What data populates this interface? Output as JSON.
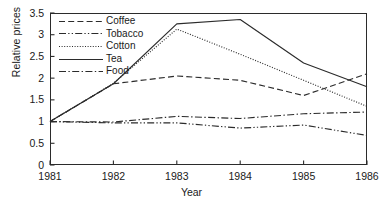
{
  "chart_data": {
    "type": "line",
    "title": "",
    "xlabel": "Year",
    "ylabel": "Relative prices",
    "x": [
      1981,
      1982,
      1983,
      1984,
      1985,
      1986
    ],
    "xtick_labels": [
      "1981",
      "1982",
      "1983",
      "1984",
      "1985",
      "1986"
    ],
    "ytick_labels": [
      "0",
      "0.5",
      "1",
      "1.5",
      "2",
      "2.5",
      "3",
      "3.5"
    ],
    "ytick_values": [
      0,
      0.5,
      1,
      1.5,
      2,
      2.5,
      3,
      3.5
    ],
    "xlim": [
      1981,
      1986
    ],
    "ylim": [
      0,
      3.5
    ],
    "grid": false,
    "legend_position": "upper-left-inside",
    "series": [
      {
        "name": "Coffee",
        "dash": "dashed",
        "color": "#2b2b2b",
        "values": [
          1.0,
          1.87,
          2.05,
          1.95,
          1.6,
          2.1
        ]
      },
      {
        "name": "Tobacco",
        "dash": "dash-dot-dot",
        "color": "#2b2b2b",
        "values": [
          1.0,
          0.97,
          0.97,
          0.85,
          0.92,
          0.68
        ]
      },
      {
        "name": "Cotton",
        "dash": "dotted",
        "color": "#2b2b2b",
        "values": [
          1.0,
          1.88,
          3.13,
          2.55,
          1.95,
          1.35
        ]
      },
      {
        "name": "Tea",
        "dash": "solid",
        "color": "#2b2b2b",
        "values": [
          1.0,
          1.87,
          3.25,
          3.35,
          2.35,
          1.8
        ]
      },
      {
        "name": "Food",
        "dash": "dash-dot",
        "color": "#2b2b2b",
        "values": [
          1.0,
          0.99,
          1.12,
          1.07,
          1.18,
          1.22
        ]
      }
    ]
  },
  "axes": {
    "ylabel": "Relative prices",
    "xlabel": "Year"
  },
  "legend": {
    "items": [
      {
        "label": "Coffee"
      },
      {
        "label": "Tobacco"
      },
      {
        "label": "Cotton"
      },
      {
        "label": "Tea"
      },
      {
        "label": "Food"
      }
    ]
  }
}
